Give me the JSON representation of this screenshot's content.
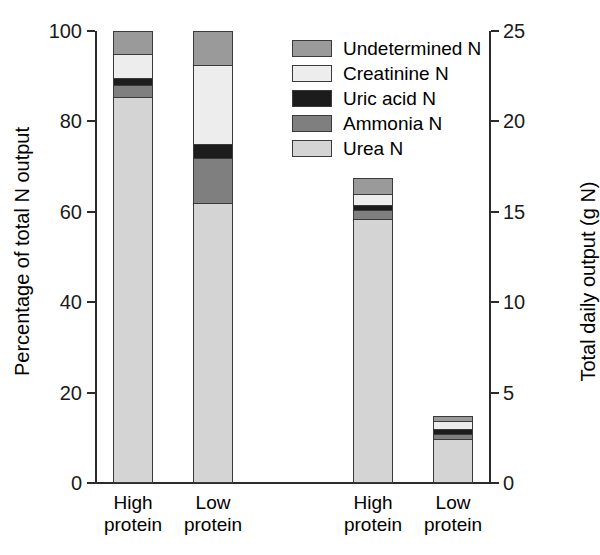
{
  "chart_data": {
    "type": "bar",
    "subtype": "stacked-bar",
    "title": "",
    "categories": [
      "High protein",
      "Low protein",
      "High protein",
      "Low protein"
    ],
    "groups": [
      {
        "name": "Percentage of total N output",
        "bars": [
          0,
          1
        ]
      },
      {
        "name": "Total daily output (g N)",
        "bars": [
          2,
          3
        ]
      }
    ],
    "series": [
      {
        "name": "Undetermined N",
        "color": "#9a9a9a",
        "values": [
          5.0,
          7.5,
          3.5,
          1.1
        ]
      },
      {
        "name": "Creatinine N",
        "color": "#ededed",
        "values": [
          5.5,
          17.5,
          2.5,
          1.7
        ]
      },
      {
        "name": "Uric acid N",
        "color": "#1c1c1c",
        "values": [
          1.5,
          3.0,
          1.0,
          1.2
        ]
      },
      {
        "name": "Ammonia N",
        "color": "#7f7f7f",
        "values": [
          2.5,
          10.0,
          2.0,
          1.0
        ]
      },
      {
        "name": "Urea N",
        "color": "#d4d4d4",
        "values": [
          85.5,
          62.0,
          58.5,
          9.8
        ]
      }
    ],
    "bar_totals_percent": [
      100.0,
      100.0,
      67.5,
      14.8
    ],
    "bar_totals_gN": [
      25.0,
      25.0,
      16.9,
      3.7
    ],
    "xlabel": "",
    "ylabel": "Percentage of total N output",
    "ylabel_right": "Total daily output (g N)",
    "ylim": [
      0,
      100
    ],
    "ylim_right": [
      0,
      25
    ],
    "yticks": [
      0,
      20,
      40,
      60,
      80,
      100
    ],
    "yticks_right": [
      0,
      5,
      10,
      15,
      20,
      25
    ],
    "grid": false,
    "legend_position": "top-right"
  },
  "axes": {
    "left": {
      "label": "Percentage of total N output",
      "ticks": [
        "0",
        "20",
        "40",
        "60",
        "80",
        "100"
      ]
    },
    "right": {
      "label": "Total daily output (g N)",
      "ticks": [
        "0",
        "5",
        "10",
        "15",
        "20",
        "25"
      ]
    },
    "categories": [
      {
        "line1": "High",
        "line2": "protein"
      },
      {
        "line1": "Low",
        "line2": "protein"
      },
      {
        "line1": "High",
        "line2": "protein"
      },
      {
        "line1": "Low",
        "line2": "protein"
      }
    ]
  },
  "legend": {
    "items": [
      {
        "label": "Undetermined N",
        "color": "#9a9a9a"
      },
      {
        "label": "Creatinine N",
        "color": "#ededed"
      },
      {
        "label": "Uric acid N",
        "color": "#1c1c1c"
      },
      {
        "label": "Ammonia N",
        "color": "#7f7f7f"
      },
      {
        "label": "Urea N",
        "color": "#d4d4d4"
      }
    ]
  }
}
